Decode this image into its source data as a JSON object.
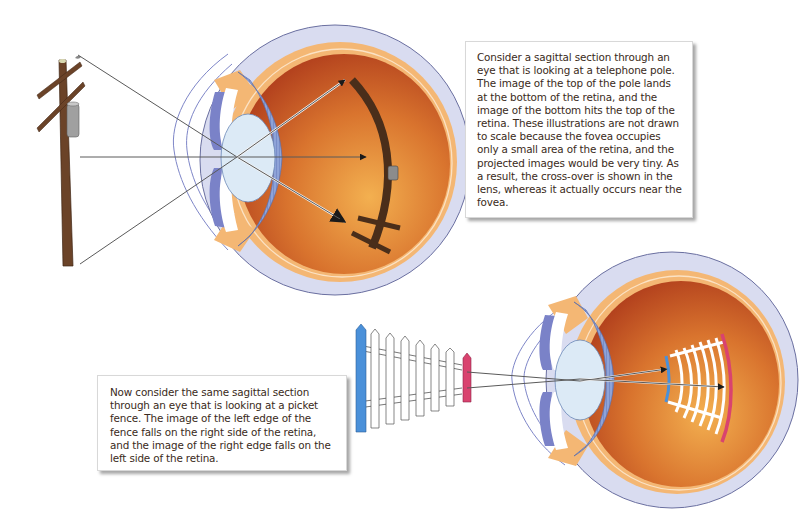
{
  "callouts": {
    "top": {
      "text": "Consider a sagittal section through an eye that is looking at a telephone pole. The image of the top of the pole lands at the bottom of the retina, and the image of the bottom hits the top of the retina. These illustrations are not drawn to scale because the fovea occupies only a small area of the retina, and the projected images would be very tiny. As a result, the cross-over is shown in the lens, whereas it actually occurs near the fovea."
    },
    "bottom": {
      "text": "Now consider the same sagittal section through an eye that is looking at a picket fence. The image of the left edge of the fence falls on the right side of the retina, and the image of the right edge falls on the left side of the retina."
    }
  },
  "figures": {
    "top": {
      "object": "telephone pole",
      "icon": "telephone-pole-icon"
    },
    "bottom": {
      "object": "picket fence",
      "icon": "picket-fence-icon"
    }
  },
  "colors": {
    "sclera": "#d9dcf0",
    "choroid": "#f4b774",
    "vitreous_dark": "#b9461f",
    "vitreous_light": "#f0a448",
    "lens": "#dceaf6",
    "ciliary": "#7f95cf",
    "iris": "#7a82c8",
    "pole": "#6b4328",
    "fence_left": "#4a90d9",
    "fence_right": "#d9436f",
    "box_border": "#d8d8d8"
  }
}
